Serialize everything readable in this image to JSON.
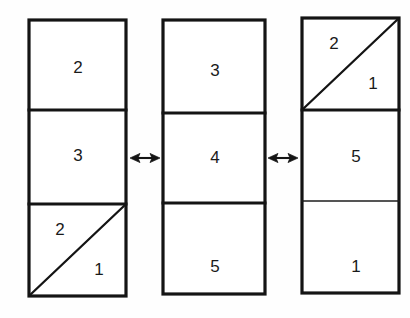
{
  "figure": {
    "background_color": "#fefefe",
    "ink_color": "#141414",
    "columns": [
      {
        "id": "column-left",
        "x": 29,
        "y": 20,
        "width": 97,
        "height": 276,
        "dividers": [
          110,
          204
        ],
        "cells": [
          {
            "id": "left-cell-top",
            "top": 20,
            "bottom": 110,
            "split": "none",
            "labels": [
              {
                "name": "label-2",
                "text": "2",
                "x": 78,
                "y": 69
              }
            ]
          },
          {
            "id": "left-cell-middle",
            "top": 110,
            "bottom": 204,
            "split": "none",
            "labels": [
              {
                "name": "label-3",
                "text": "3",
                "x": 78,
                "y": 157
              }
            ]
          },
          {
            "id": "left-cell-bottom",
            "top": 204,
            "bottom": 296,
            "split": "diagonal-bl-to-tr",
            "labels": [
              {
                "name": "label-2-upper-triangle",
                "text": "2",
                "x": 60,
                "y": 231
              },
              {
                "name": "label-1-lower-triangle",
                "text": "1",
                "x": 99,
                "y": 271
              }
            ]
          }
        ]
      },
      {
        "id": "column-middle",
        "x": 163,
        "y": 20,
        "width": 102,
        "height": 274,
        "dividers": [
          113,
          203
        ],
        "cells": [
          {
            "id": "middle-cell-top",
            "top": 20,
            "bottom": 113,
            "split": "none",
            "labels": [
              {
                "name": "label-3",
                "text": "3",
                "x": 215,
                "y": 72
              }
            ]
          },
          {
            "id": "middle-cell-middle",
            "top": 113,
            "bottom": 203,
            "split": "none",
            "labels": [
              {
                "name": "label-4",
                "text": "4",
                "x": 215,
                "y": 159
              }
            ]
          },
          {
            "id": "middle-cell-bottom",
            "top": 203,
            "bottom": 294,
            "split": "none",
            "labels": [
              {
                "name": "label-5",
                "text": "5",
                "x": 215,
                "y": 268
              }
            ]
          }
        ]
      },
      {
        "id": "column-right",
        "x": 302,
        "y": 18,
        "width": 97,
        "height": 275,
        "dividers": [
          110,
          201
        ],
        "cells": [
          {
            "id": "right-cell-top",
            "top": 18,
            "bottom": 110,
            "split": "diagonal-bl-to-tr",
            "labels": [
              {
                "name": "label-2-upper-triangle",
                "text": "2",
                "x": 334,
                "y": 45
              },
              {
                "name": "label-1-lower-triangle",
                "text": "1",
                "x": 373,
                "y": 85
              }
            ]
          },
          {
            "id": "right-cell-middle",
            "top": 110,
            "bottom": 201,
            "split": "none",
            "labels": [
              {
                "name": "label-5",
                "text": "5",
                "x": 356,
                "y": 158
              }
            ]
          },
          {
            "id": "right-cell-bottom",
            "top": 201,
            "bottom": 293,
            "split": "none",
            "labels": [
              {
                "name": "label-1",
                "text": "1",
                "x": 356,
                "y": 268
              }
            ]
          }
        ]
      }
    ],
    "arrows": [
      {
        "id": "arrow-left-middle",
        "glyph": "double-headed-arrow",
        "symbol": "↔",
        "cx": 145,
        "cy": 158,
        "half_length": 15
      },
      {
        "id": "arrow-middle-right",
        "glyph": "double-headed-arrow",
        "symbol": "↔",
        "cx": 283,
        "cy": 158,
        "half_length": 15
      }
    ]
  }
}
